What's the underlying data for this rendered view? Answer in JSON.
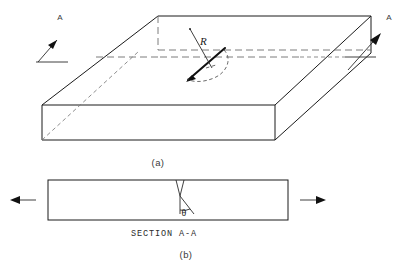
{
  "figure": {
    "panels": [
      {
        "id": "panel-a",
        "caption": "(a)",
        "description": "Three-dimensional view of a rectangular plate containing an embedded inclined penny-shaped crack, with section cutting line A-A and applied far-field tensile load arrows.",
        "labels": {
          "section_line_left": "A",
          "section_line_right": "A",
          "crack_radius": "R"
        }
      },
      {
        "id": "panel-b",
        "caption": "(b)",
        "description": "Section A-A through the plate showing the crack inclined at angle theta from the plate normal, loaded in tension.",
        "labels": {
          "title": "SECTION A-A",
          "angle": "θ"
        }
      }
    ],
    "colors": {
      "line": "#1a1a1a",
      "hidden_line": "#6d6d6d",
      "crack": "#111111",
      "background": "#ffffff",
      "arc": "#4f4f4f"
    }
  }
}
